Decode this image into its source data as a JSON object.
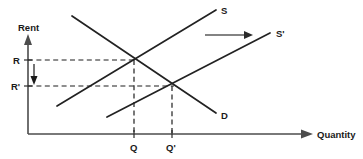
{
  "figure": {
    "kind": "supply-demand-diagram",
    "background_color": "#ffffff",
    "curve_color": "#222222",
    "axis_color": "#4c4c4c",
    "dash_color": "#1e1e1e"
  },
  "axes": {
    "y_label": "Rent",
    "x_label": "Quantity",
    "origin_x": 28,
    "origin_y": 134,
    "y_top": 40,
    "x_right": 312
  },
  "y_ticks": [
    {
      "label": "R",
      "y": 60,
      "text_x": 13,
      "text_y": 63
    },
    {
      "label": "R'",
      "y": 86,
      "text_x": 11,
      "text_y": 89
    }
  ],
  "x_ticks": [
    {
      "label": "Q",
      "x": 134,
      "text_x": 130,
      "text_y": 151
    },
    {
      "label": "Q'",
      "x": 172,
      "text_x": 167,
      "text_y": 151
    }
  ],
  "curves": [
    {
      "name": "supply",
      "label": "S",
      "x1": 57,
      "y1": 106,
      "x2": 216,
      "y2": 10,
      "label_x": 221,
      "label_y": 14
    },
    {
      "name": "supply-shifted",
      "label": "S'",
      "x1": 107,
      "y1": 117,
      "x2": 270,
      "y2": 33,
      "label_x": 276,
      "label_y": 36
    },
    {
      "name": "demand",
      "label": "D",
      "x1": 72,
      "y1": 16,
      "x2": 216,
      "y2": 113,
      "label_x": 221,
      "label_y": 118
    }
  ],
  "equilibria": [
    {
      "name": "initial",
      "x": 134,
      "y": 60
    },
    {
      "name": "new",
      "x": 172,
      "y": 86
    }
  ],
  "annotations": {
    "shift_arrow": {
      "name": "supply-shift-arrow",
      "x1": 205,
      "y1": 35,
      "x2": 250,
      "y2": 35,
      "direction": "right"
    },
    "rent_drop_arrow": {
      "name": "rent-decrease-arrow",
      "x": 34,
      "y1": 64,
      "y2": 82,
      "direction": "down"
    }
  }
}
